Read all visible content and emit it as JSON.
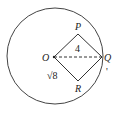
{
  "diagram": {
    "type": "geometry",
    "circle": {
      "center": "O",
      "cx": 55,
      "cy": 56,
      "r": 48
    },
    "points": {
      "O": {
        "label": "O",
        "x": 54,
        "y": 57
      },
      "P": {
        "label": "P",
        "x": 78,
        "y": 34
      },
      "Q": {
        "label": "Q",
        "x": 102,
        "y": 57
      },
      "R": {
        "label": "R",
        "x": 78,
        "y": 81
      }
    },
    "segments": [
      "OP",
      "PQ",
      "QR",
      "RO"
    ],
    "dashed_segments": [
      "OQ"
    ],
    "labels": {
      "oq_length": "4",
      "or_length": "√8"
    },
    "stray_mark": "'"
  }
}
